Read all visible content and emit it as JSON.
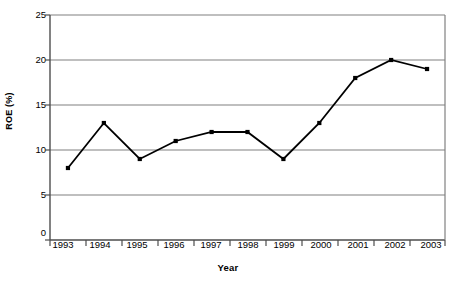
{
  "figure": {
    "cut_title": "",
    "xlabel": "Year",
    "ylabel": "ROE (%)"
  },
  "yticks": [
    "0",
    "5",
    "10",
    "15",
    "20",
    "25"
  ],
  "xticks": [
    "1993",
    "1994",
    "1995",
    "1996",
    "1997",
    "1998",
    "1999",
    "2000",
    "2001",
    "2002",
    "2003"
  ],
  "colors": {
    "line": "#000000",
    "marker": "#000000",
    "grid": "#808080",
    "axis": "#4d4d4d",
    "background": "#ffffff"
  },
  "chart_data": {
    "type": "line",
    "title": "",
    "xlabel": "Year",
    "ylabel": "ROE (%)",
    "categories": [
      "1993",
      "1994",
      "1995",
      "1996",
      "1997",
      "1998",
      "1999",
      "2000",
      "2001",
      "2002",
      "2003"
    ],
    "values": [
      8,
      13,
      9,
      11,
      12,
      12,
      9,
      13,
      18,
      20,
      19
    ],
    "series": [
      {
        "name": "ROE (%)",
        "values": [
          8,
          13,
          9,
          11,
          12,
          12,
          9,
          13,
          18,
          20,
          19
        ]
      }
    ],
    "ylim": [
      0,
      25
    ],
    "ytick_values": [
      0,
      5,
      10,
      15,
      20,
      25
    ],
    "grid": "horizontal",
    "legend": "none",
    "marker": "square",
    "line_color": "#000000"
  }
}
